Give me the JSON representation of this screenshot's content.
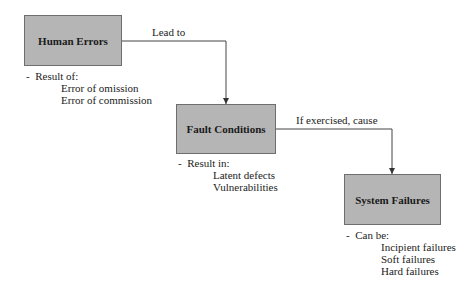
{
  "diagram": {
    "nodes": [
      {
        "id": "human-errors",
        "label": "Human Errors",
        "note_head": "Result of:",
        "note_items": [
          "Error of omission",
          "Error of commission"
        ]
      },
      {
        "id": "fault-conditions",
        "label": "Fault Conditions",
        "note_head": "Result in:",
        "note_items": [
          "Latent defects",
          "Vulnerabilities"
        ]
      },
      {
        "id": "system-failures",
        "label": "System Failures",
        "note_head": "Can be:",
        "note_items": [
          "Incipient failures",
          "Soft failures",
          "Hard failures"
        ]
      }
    ],
    "edges": [
      {
        "from": "human-errors",
        "to": "fault-conditions",
        "label": "Lead to"
      },
      {
        "from": "fault-conditions",
        "to": "system-failures",
        "label": "If exercised, cause"
      }
    ],
    "bullet": "-",
    "colors": {
      "box_fill": "#b5b5b5",
      "box_border": "#6e6e6e",
      "line": "#444444"
    }
  }
}
